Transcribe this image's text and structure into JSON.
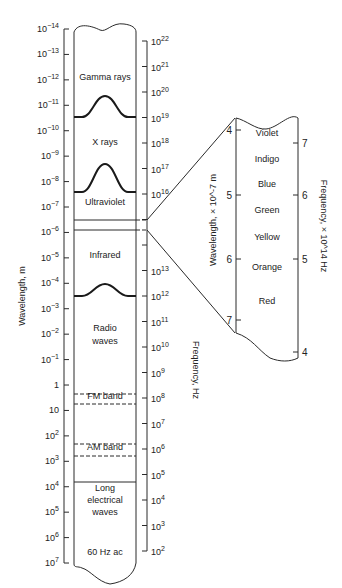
{
  "chart_data": {
    "type": "diagram",
    "left_axis": {
      "label": "Wavelength, m",
      "ticks": [
        "10^-14",
        "10^-13",
        "10^-12",
        "10^-11",
        "10^-10",
        "10^-9",
        "10^-8",
        "10^-7",
        "10^-6",
        "10^-5",
        "10^-4",
        "10^-3",
        "10^-2",
        "10^-1",
        "1",
        "10",
        "10^2",
        "10^3",
        "10^4",
        "10^5",
        "10^6",
        "10^7"
      ]
    },
    "right_axis": {
      "label": "Frequency, Hz",
      "ticks": [
        "10^22",
        "10^21",
        "10^20",
        "10^19",
        "10^18",
        "10^17",
        "10^16",
        "",
        "",
        "10^13",
        "10^12",
        "10^11",
        "10^10",
        "10^9",
        "10^8",
        "10^7",
        "10^6",
        "10^5",
        "10^4",
        "10^3",
        "10^2"
      ]
    },
    "regions": [
      {
        "label": "Gamma rays",
        "y": 80
      },
      {
        "label": "X rays",
        "y": 145
      },
      {
        "label": "Ultraviolet",
        "y": 205
      },
      {
        "label": "Infrared",
        "y": 258
      },
      {
        "label": "Radio",
        "y": 331
      },
      {
        "label": "waves",
        "y": 344
      },
      {
        "label": "FM band",
        "y": 399
      },
      {
        "label": "AM band",
        "y": 450
      },
      {
        "label": "Long",
        "y": 491
      },
      {
        "label": "electrical",
        "y": 503
      },
      {
        "label": "waves",
        "y": 515
      },
      {
        "label": "60 Hz ac",
        "y": 555
      }
    ],
    "visible_inset": {
      "left_axis_label": "Wavelength, × 10^-7 m",
      "right_axis_label": "Frequency, × 10^14 Hz",
      "left_ticks": [
        {
          "label": "4",
          "y": 130
        },
        {
          "label": "5",
          "y": 195
        },
        {
          "label": "6",
          "y": 259
        },
        {
          "label": "7",
          "y": 320
        }
      ],
      "right_ticks": [
        {
          "label": "7",
          "y": 143
        },
        {
          "label": "6",
          "y": 195
        },
        {
          "label": "5",
          "y": 259
        },
        {
          "label": "4",
          "y": 352
        }
      ],
      "colors": [
        {
          "label": "Violet",
          "y": 136
        },
        {
          "label": "Indigo",
          "y": 162
        },
        {
          "label": "Blue",
          "y": 187
        },
        {
          "label": "Green",
          "y": 213
        },
        {
          "label": "Yellow",
          "y": 240
        },
        {
          "label": "Orange",
          "y": 270
        },
        {
          "label": "Red",
          "y": 304
        }
      ]
    }
  }
}
